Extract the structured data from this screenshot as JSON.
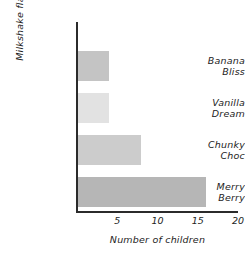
{
  "chart_data": {
    "type": "bar",
    "orientation": "horizontal",
    "title": "",
    "xlabel": "Number of children",
    "ylabel": "Milkshake flavors",
    "categories": [
      "Banana Bliss",
      "Vanilla Dream",
      "Chunky Choc",
      "Merry Berry"
    ],
    "values": [
      4,
      4,
      8,
      16
    ],
    "xlim": [
      0,
      20
    ],
    "xticks": [
      5,
      10,
      15,
      20
    ],
    "xtick_labels": [
      "5",
      "10",
      "15",
      "20"
    ],
    "grid": false,
    "legend": false,
    "bar_colors": [
      "#c4c4c4",
      "#e2e2e2",
      "#cccccc",
      "#b6b6b6"
    ],
    "axis_color": "#2b2b2b",
    "background": "#ffffff",
    "bars": [
      {
        "label_line1": "Banana",
        "label_line2": "Bliss",
        "value": 4,
        "color": "#c4c4c4"
      },
      {
        "label_line1": "Vanilla",
        "label_line2": "Dream",
        "value": 4,
        "color": "#e2e2e2"
      },
      {
        "label_line1": "Chunky",
        "label_line2": "Choc",
        "value": 8,
        "color": "#cccccc"
      },
      {
        "label_line1": "Merry",
        "label_line2": "Berry",
        "value": 16,
        "color": "#b6b6b6"
      }
    ]
  }
}
